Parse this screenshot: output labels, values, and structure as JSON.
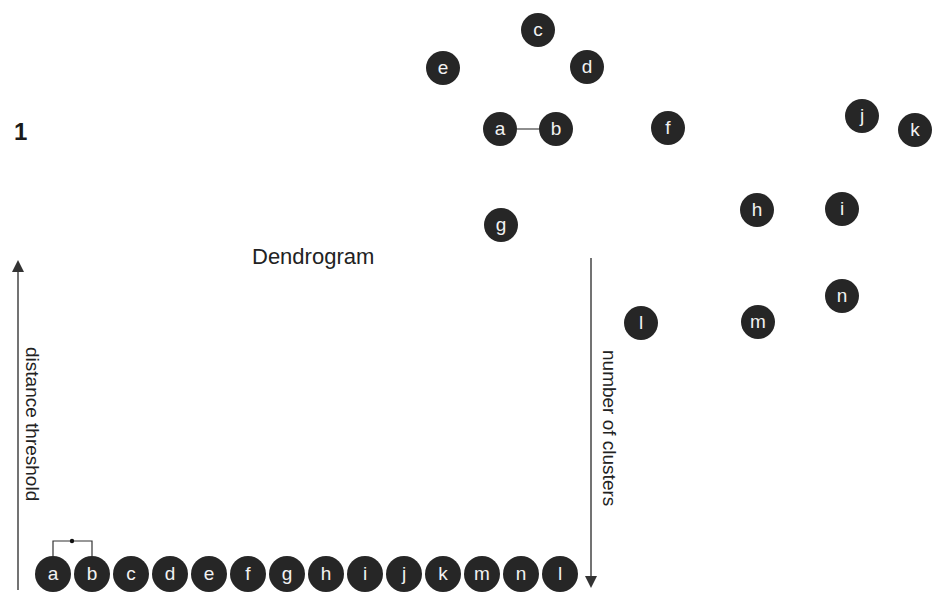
{
  "panel_number": "1",
  "title": "Dendrogram",
  "axes": {
    "left_label": "distance threshold",
    "right_label": "number of clusters"
  },
  "scatter_nodes": [
    {
      "label": "c",
      "x": 538,
      "y": 30
    },
    {
      "label": "e",
      "x": 443,
      "y": 68
    },
    {
      "label": "d",
      "x": 587,
      "y": 67
    },
    {
      "label": "a",
      "x": 500,
      "y": 129
    },
    {
      "label": "b",
      "x": 556,
      "y": 129
    },
    {
      "label": "f",
      "x": 668,
      "y": 128
    },
    {
      "label": "j",
      "x": 862,
      "y": 116
    },
    {
      "label": "k",
      "x": 915,
      "y": 130
    },
    {
      "label": "h",
      "x": 757,
      "y": 210
    },
    {
      "label": "i",
      "x": 842,
      "y": 209
    },
    {
      "label": "g",
      "x": 501,
      "y": 225
    },
    {
      "label": "n",
      "x": 842,
      "y": 296
    },
    {
      "label": "l",
      "x": 641,
      "y": 323
    },
    {
      "label": "m",
      "x": 758,
      "y": 322
    }
  ],
  "scatter_links": [
    {
      "from": "a",
      "to": "b"
    }
  ],
  "dendrogram_leaves": [
    "a",
    "b",
    "c",
    "d",
    "e",
    "f",
    "g",
    "h",
    "i",
    "j",
    "k",
    "m",
    "n",
    "l"
  ],
  "dendrogram_merges": [
    {
      "left": "a",
      "right": "b"
    }
  ],
  "colors": {
    "node_fill": "#262626",
    "node_text": "#f2f2f2",
    "line": "#444444"
  }
}
